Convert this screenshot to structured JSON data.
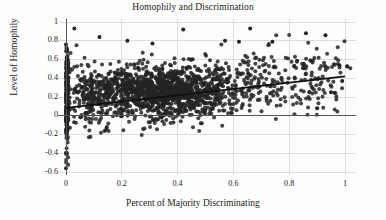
{
  "chart_data": {
    "type": "scatter",
    "title": "Homophily and Discrimination",
    "xlabel": "Percent of Majority Discriminating",
    "ylabel": "Level of Homophily",
    "xlim": [
      -0.03,
      1.04
    ],
    "ylim": [
      -0.63,
      1.03
    ],
    "xticks": [
      0,
      0.2,
      0.4,
      0.6,
      0.8,
      1
    ],
    "xtick_labels": [
      "0",
      "0.2",
      "0.4",
      "0.6",
      "0.8",
      "1"
    ],
    "yticks": [
      -0.6,
      -0.4,
      -0.2,
      0,
      0.2,
      0.4,
      0.6,
      0.8,
      1
    ],
    "ytick_labels": [
      "-0.6",
      "-0.4",
      "-0.2",
      "0",
      "0.2",
      "0.4",
      "0.6",
      "0.8",
      "1"
    ],
    "grid": true,
    "grid_color": "#cfcfcf",
    "legend": null,
    "point_color": "#232323",
    "point_size": 2.0,
    "point_opacity": 0.85,
    "reference_lines": [
      {
        "name": "zero-horizontal",
        "orientation": "horizontal",
        "y": 0,
        "color": "#555555",
        "width": 1.0
      },
      {
        "name": "zero-vertical",
        "orientation": "vertical",
        "x": 0,
        "color": "#555555",
        "width": 1.0
      }
    ],
    "fit_line": {
      "name": "regression-line",
      "type": "linear",
      "x_start": 0,
      "y_start": 0.085,
      "x_end": 1.0,
      "y_end": 0.42,
      "slope": 0.335,
      "intercept": 0.085,
      "color": "#111111",
      "width": 1.7
    },
    "series": [
      {
        "name": "observations",
        "n_points": 2000,
        "description": "Dense cloud concentrated between x=0.15 and x=0.6 with homophily 0 to 0.5; a tall spike of points at x=0 spanning -0.56 to 0.76; sparse scatter to the right of x=0.65.",
        "clusters": [
          {
            "name": "x-zero-spike",
            "n": 260,
            "x_center": 0.0,
            "x_spread": 0.004,
            "y_center": 0.18,
            "y_spread": 0.26,
            "y_min": -0.56,
            "y_max": 0.76
          },
          {
            "name": "main-cloud",
            "n": 1180,
            "x_center": 0.37,
            "x_spread": 0.12,
            "y_center": 0.26,
            "y_spread": 0.14,
            "y_min": -0.22,
            "y_max": 0.72
          },
          {
            "name": "left-mid",
            "n": 300,
            "x_center": 0.12,
            "x_spread": 0.07,
            "y_center": 0.22,
            "y_spread": 0.17,
            "y_min": -0.24,
            "y_max": 0.78
          },
          {
            "name": "right-sparse",
            "n": 200,
            "x_center": 0.7,
            "x_spread": 0.13,
            "y_center": 0.36,
            "y_spread": 0.17,
            "y_min": -0.12,
            "y_max": 0.93
          },
          {
            "name": "far-right-sparse",
            "n": 60,
            "x_center": 0.93,
            "x_spread": 0.06,
            "y_center": 0.42,
            "y_spread": 0.19,
            "y_min": 0.0,
            "y_max": 0.88
          }
        ]
      }
    ]
  }
}
